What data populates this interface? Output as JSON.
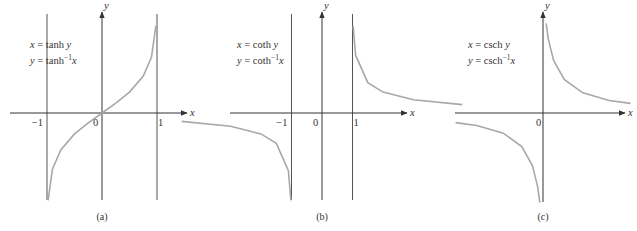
{
  "colors": {
    "axis": "#333333",
    "asymptote": "#555555",
    "curve": "#a8a8a8",
    "background": "#ffffff"
  },
  "chart_data": [
    {
      "type": "line",
      "caption": "(a)",
      "title": "",
      "xlabel": "x",
      "ylabel": "y",
      "equations": [
        {
          "lhs": "x",
          "fn": "tanh",
          "arg": "y",
          "sup": ""
        },
        {
          "lhs": "y",
          "fn": "tanh",
          "arg": "x",
          "sup": "−1"
        }
      ],
      "x_ticks": [
        {
          "value": -1,
          "label": "−1"
        },
        {
          "value": 0,
          "label": "0"
        },
        {
          "value": 1,
          "label": "1"
        }
      ],
      "vertical_asymptotes": [
        -1,
        1
      ],
      "series": [
        {
          "name": "y = tanh^-1 x",
          "x": [
            -0.98,
            -0.9,
            -0.75,
            -0.5,
            -0.25,
            0,
            0.25,
            0.5,
            0.75,
            0.9,
            0.98
          ],
          "y": [
            -2.3,
            -1.47,
            -0.97,
            -0.55,
            -0.26,
            0,
            0.26,
            0.55,
            0.97,
            1.47,
            2.3
          ]
        }
      ],
      "layout": {
        "origin_px": [
          102,
          113
        ],
        "unit_px": 55,
        "y_unit_px": 38,
        "axis_x_px": [
          10,
          187
        ],
        "axis_y_top_px": 12,
        "axis_y_bottom_px": 200,
        "eq_px": [
          30,
          48
        ]
      }
    },
    {
      "type": "line",
      "caption": "(b)",
      "title": "",
      "xlabel": "x",
      "ylabel": "y",
      "equations": [
        {
          "lhs": "x",
          "fn": "coth",
          "arg": "y",
          "sup": ""
        },
        {
          "lhs": "y",
          "fn": "coth",
          "arg": "x",
          "sup": "−1"
        }
      ],
      "x_ticks": [
        {
          "value": -1,
          "label": "−1"
        },
        {
          "value": 0,
          "label": "0"
        },
        {
          "value": 1,
          "label": "1"
        }
      ],
      "vertical_asymptotes": [
        -1,
        1
      ],
      "series": [
        {
          "name": "y = coth^-1 x (x>1)",
          "x": [
            1.02,
            1.1,
            1.5,
            2,
            3,
            4.6
          ],
          "y": [
            2.3,
            1.52,
            0.8,
            0.55,
            0.35,
            0.22
          ]
        },
        {
          "name": "y = coth^-1 x (x<-1)",
          "x": [
            -4.6,
            -3,
            -2,
            -1.5,
            -1.1,
            -1.02
          ],
          "y": [
            -0.22,
            -0.35,
            -0.55,
            -0.8,
            -1.52,
            -2.3
          ]
        }
      ],
      "layout": {
        "origin_px": [
          322,
          113
        ],
        "unit_px": 30.5,
        "y_unit_px": 38,
        "axis_x_px": [
          230,
          407
        ],
        "axis_y_top_px": 12,
        "axis_y_bottom_px": 200,
        "eq_px": [
          237,
          48
        ]
      }
    },
    {
      "type": "line",
      "caption": "(c)",
      "title": "",
      "xlabel": "x",
      "ylabel": "y",
      "equations": [
        {
          "lhs": "x",
          "fn": "csch",
          "arg": "y",
          "sup": ""
        },
        {
          "lhs": "y",
          "fn": "csch",
          "arg": "x",
          "sup": "−1"
        }
      ],
      "x_ticks": [
        {
          "value": 0,
          "label": "0"
        }
      ],
      "vertical_asymptotes": [],
      "series": [
        {
          "name": "y = csch^-1 x (x>0)",
          "x": [
            0.12,
            0.2,
            0.4,
            0.8,
            1.5,
            2.5,
            3.3
          ],
          "y": [
            2.8,
            2.31,
            1.64,
            1.05,
            0.63,
            0.39,
            0.3
          ]
        },
        {
          "name": "y = csch^-1 x (x<0)",
          "x": [
            -3.3,
            -2.5,
            -1.5,
            -0.8,
            -0.4,
            -0.2,
            -0.12
          ],
          "y": [
            -0.3,
            -0.39,
            -0.63,
            -1.05,
            -1.64,
            -2.31,
            -2.8
          ]
        }
      ],
      "layout": {
        "origin_px": [
          543,
          113
        ],
        "unit_px": 26.5,
        "y_unit_px": 32,
        "axis_x_px": [
          455,
          625
        ],
        "axis_y_top_px": 12,
        "axis_y_bottom_px": 202,
        "eq_px": [
          468,
          48
        ]
      }
    }
  ]
}
